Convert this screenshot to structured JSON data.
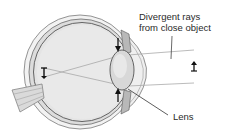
{
  "diagram": {
    "labels": {
      "rays_line1": "Divergent rays",
      "rays_line2": "from close object",
      "lens": "Lens"
    },
    "elements": [
      {
        "id": "eyeball",
        "description": "cross-section of eyeball"
      },
      {
        "id": "lens",
        "description": "rounded (accommodated) lens"
      },
      {
        "id": "optic-nerve",
        "description": "optic nerve exiting back of eye"
      },
      {
        "id": "object",
        "description": "small upright arrow object at right"
      },
      {
        "id": "retinal-image",
        "description": "inverted image on retina at left"
      },
      {
        "id": "ciliary-arrows",
        "description": "arrows above and below lens pointing inward"
      }
    ],
    "colors": {
      "outline": "#555555",
      "fill_light": "#e6e6e6",
      "fill_mid": "#cfcfcf",
      "ray": "#a8a8a8",
      "text": "#2a2a2a"
    }
  }
}
